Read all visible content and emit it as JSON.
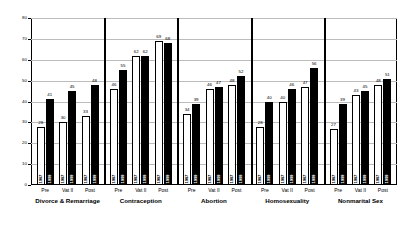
{
  "chart_data": {
    "type": "bar",
    "title": "",
    "subtitle": "",
    "xlabel": "",
    "ylabel": "",
    "ylim": [
      0,
      80
    ],
    "yticks": [
      0,
      10,
      20,
      30,
      40,
      50,
      60,
      70,
      80
    ],
    "grid": true,
    "legend_position": "none",
    "series": [
      {
        "name": "1987",
        "color": "#ffffff"
      },
      {
        "name": "1999",
        "color": "#000000"
      }
    ],
    "cohorts": [
      "Pre",
      "Vat II",
      "Post"
    ],
    "categories": [
      "Divorce & Remarriage",
      "Contraception",
      "Abortion",
      "Homosexuality",
      "Nonmarital Sex"
    ],
    "groups": [
      {
        "category": "Divorce & Remarriage",
        "cohorts": [
          {
            "label": "Pre",
            "bars": [
              {
                "series": "1987",
                "value": 28
              },
              {
                "series": "1999",
                "value": 41
              }
            ]
          },
          {
            "label": "Vat II",
            "bars": [
              {
                "series": "1987",
                "value": 30
              },
              {
                "series": "1999",
                "value": 45
              }
            ]
          },
          {
            "label": "Post",
            "bars": [
              {
                "series": "1987",
                "value": 33
              },
              {
                "series": "1999",
                "value": 48
              }
            ]
          }
        ]
      },
      {
        "category": "Contraception",
        "cohorts": [
          {
            "label": "Pre",
            "bars": [
              {
                "series": "1987",
                "value": 46
              },
              {
                "series": "1999",
                "value": 55
              }
            ]
          },
          {
            "label": "Vat II",
            "bars": [
              {
                "series": "1987",
                "value": 62
              },
              {
                "series": "1999",
                "value": 62
              }
            ]
          },
          {
            "label": "Post",
            "bars": [
              {
                "series": "1987",
                "value": 69
              },
              {
                "series": "1999",
                "value": 68
              }
            ]
          }
        ]
      },
      {
        "category": "Abortion",
        "cohorts": [
          {
            "label": "Pre",
            "bars": [
              {
                "series": "1987",
                "value": 34
              },
              {
                "series": "1999",
                "value": 39
              }
            ]
          },
          {
            "label": "Vat II",
            "bars": [
              {
                "series": "1987",
                "value": 46
              },
              {
                "series": "1999",
                "value": 47
              }
            ]
          },
          {
            "label": "Post",
            "bars": [
              {
                "series": "1987",
                "value": 48
              },
              {
                "series": "1999",
                "value": 52
              }
            ]
          }
        ]
      },
      {
        "category": "Homosexuality",
        "cohorts": [
          {
            "label": "Pre",
            "bars": [
              {
                "series": "1987",
                "value": 28
              },
              {
                "series": "1999",
                "value": 40
              }
            ]
          },
          {
            "label": "Vat II",
            "bars": [
              {
                "series": "1987",
                "value": 40
              },
              {
                "series": "1999",
                "value": 46
              }
            ]
          },
          {
            "label": "Post",
            "bars": [
              {
                "series": "1987",
                "value": 47
              },
              {
                "series": "1999",
                "value": 56
              }
            ]
          }
        ]
      },
      {
        "category": "Nonmarital Sex",
        "cohorts": [
          {
            "label": "Pre",
            "bars": [
              {
                "series": "1987",
                "value": 27
              },
              {
                "series": "1999",
                "value": 39
              }
            ]
          },
          {
            "label": "Vat II",
            "bars": [
              {
                "series": "1987",
                "value": 43
              },
              {
                "series": "1999",
                "value": 45
              }
            ]
          },
          {
            "label": "Post",
            "bars": [
              {
                "series": "1987",
                "value": 48
              },
              {
                "series": "1999",
                "value": 51
              }
            ]
          }
        ]
      }
    ]
  }
}
